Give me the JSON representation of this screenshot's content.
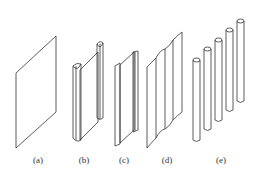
{
  "figure": {
    "panels": [
      {
        "id": "a",
        "label": "(a)",
        "shape": "flat-plate",
        "x": 38
      },
      {
        "id": "b",
        "label": "(b)",
        "shape": "plate-with-rounded-edge-stiffeners",
        "x": 84
      },
      {
        "id": "c",
        "label": "(c)",
        "shape": "plate-with-flat-edge-stiffeners",
        "x": 124
      },
      {
        "id": "d",
        "label": "(d)",
        "shape": "corrugated-plate",
        "x": 167
      },
      {
        "id": "e",
        "label": "(e)",
        "shape": "row-of-cylindrical-rods",
        "x": 221
      }
    ],
    "line_color": "#333333"
  }
}
